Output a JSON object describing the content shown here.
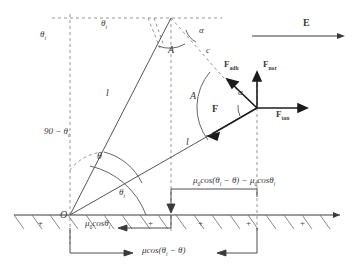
{
  "diagram": {
    "field_label": "E",
    "apex_angle_alpha": "α",
    "apex_angle_theta_i": "θ",
    "apex_angle_theta_i_sub": "i",
    "arc_label_top": "A",
    "arc_label_mid": "A",
    "side_c": "c",
    "length_left": "l",
    "length_lower": "l",
    "origin": "O",
    "angle_90_minus": "90 − θ",
    "angle_90_minus_sub": "i",
    "angle_theta": "θ",
    "angle_theta_i": "θ",
    "angle_theta_i_sub": "i",
    "force_F": "F",
    "force_adh": "F",
    "force_adh_sub": "adh",
    "force_nor": "F",
    "force_nor_sub": "nor",
    "force_tan": "F",
    "force_tan_sub": "tan",
    "force_alpha": "α",
    "charge_symbol": "+",
    "charges": [
      "+",
      "+",
      "+",
      "+",
      "+"
    ],
    "measure_mu0_cos_theta_i": "μ",
    "measure_mu0_cos_theta_i_sub": "0",
    "measure_mu0_cos_theta_i_rest": "cosθ",
    "measure_mu0_cos_theta_i_rest_sub": "i",
    "measure_mu_cos_diff_a": "μcos(θ",
    "measure_mu_cos_diff_a_sub": "i",
    "measure_mu_cos_diff_b": " − θ)",
    "measure_top_a": "μ",
    "measure_top_a_sub": "0",
    "measure_top_b": "cos(θ",
    "measure_top_b_sub": "i",
    "measure_top_c": " − θ) − μ",
    "measure_top_c_sub": "0",
    "measure_top_d": "cosθ",
    "measure_top_d_sub": "i"
  },
  "colors": {
    "ink": "#3a3a3a",
    "line": "#555555",
    "dashed": "#7a7a7a",
    "heavy": "#1c1c1c",
    "background": "#ffffff"
  }
}
